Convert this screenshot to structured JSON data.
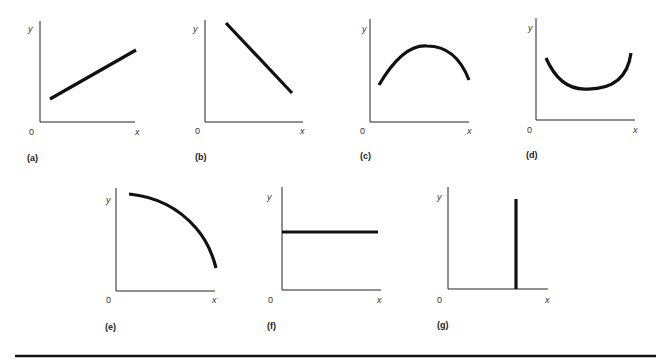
{
  "figure": {
    "panels": [
      {
        "id": "a",
        "caption": "(a)",
        "shape": "straight line, positive slope",
        "y_label": "y",
        "x_label": "x",
        "origin_label": "0"
      },
      {
        "id": "b",
        "caption": "(b)",
        "shape": "straight line, negative slope",
        "y_label": "y",
        "x_label": "x",
        "origin_label": "0"
      },
      {
        "id": "c",
        "caption": "(c)",
        "shape": "concave curve with maximum",
        "y_label": "y",
        "x_label": "x",
        "origin_label": "0"
      },
      {
        "id": "d",
        "caption": "(d)",
        "shape": "convex curve with minimum",
        "y_label": "y",
        "x_label": "x",
        "origin_label": "0"
      },
      {
        "id": "e",
        "caption": "(e)",
        "shape": "concave curve, decreasing at increasing rate",
        "y_label": "y",
        "x_label": "x",
        "origin_label": "0"
      },
      {
        "id": "f",
        "caption": "(f)",
        "shape": "horizontal line, zero slope",
        "y_label": "y",
        "x_label": "x",
        "origin_label": "0"
      },
      {
        "id": "g",
        "caption": "(g)",
        "shape": "vertical line, infinite slope",
        "y_label": "y",
        "x_label": "x",
        "origin_label": "0"
      }
    ]
  },
  "colors": {
    "line": "#111111",
    "axis": "#222222",
    "background": "#ffffff"
  }
}
